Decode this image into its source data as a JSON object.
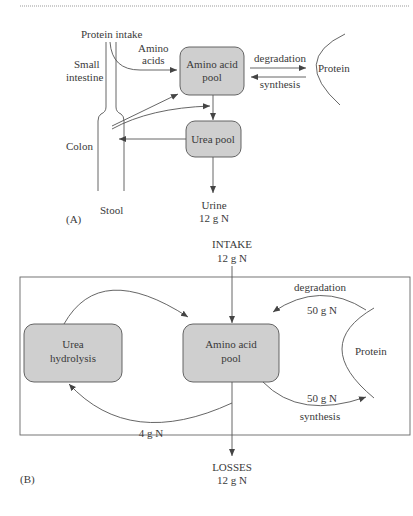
{
  "panel_a": {
    "label": "(A)",
    "protein_intake": "Protein intake",
    "amino_acids_1": "Amino",
    "amino_acids_2": "acids",
    "small_intestine_1": "Small",
    "small_intestine_2": "intestine",
    "colon": "Colon",
    "stool": "Stool",
    "amino_pool_1": "Amino acid",
    "amino_pool_2": "pool",
    "urea_pool": "Urea pool",
    "degradation": "degradation",
    "synthesis": "synthesis",
    "protein": "Protein",
    "urine": "Urine",
    "urine_amount": "12 g N"
  },
  "panel_b": {
    "label": "(B)",
    "intake": "INTAKE",
    "intake_amount": "12 g N",
    "urea_hydrolysis_1": "Urea",
    "urea_hydrolysis_2": "hydrolysis",
    "amino_pool_1": "Amino acid",
    "amino_pool_2": "pool",
    "protein": "Protein",
    "degradation": "degradation",
    "degradation_amount": "50 g N",
    "synthesis": "synthesis",
    "synthesis_amount": "50 g N",
    "recycle_amount": "4 g N",
    "losses": "LOSSES",
    "losses_amount": "12 g N"
  },
  "colors": {
    "box_fill": "#cfcfcf",
    "line": "#555555",
    "text": "#3a3a3a"
  }
}
